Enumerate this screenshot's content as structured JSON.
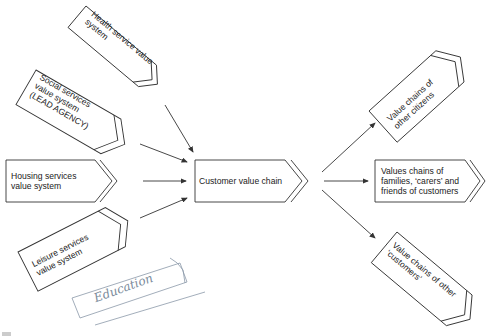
{
  "diagram": {
    "inputs": [
      {
        "id": "health",
        "label_lines": [
          "Health service value",
          "system"
        ]
      },
      {
        "id": "social",
        "label_lines": [
          "Social services",
          "value system",
          "(LEAD AGENCY)"
        ]
      },
      {
        "id": "housing",
        "label_lines": [
          "Housing services",
          "value system"
        ]
      },
      {
        "id": "leisure",
        "label_lines": [
          "Leisure services",
          "value system"
        ]
      }
    ],
    "center": {
      "label": "Customer value chain"
    },
    "outputs": [
      {
        "id": "citizens",
        "label_lines": [
          "Value chains of",
          "other citizens"
        ]
      },
      {
        "id": "families",
        "label_lines": [
          "Values chains of",
          "families, ‘carers’ and",
          "friends of customers"
        ]
      },
      {
        "id": "others",
        "label_lines": [
          "Value chains of other",
          "‘customers’"
        ]
      }
    ],
    "annotation": {
      "handwritten": "Education",
      "note": "handwritten pencil box"
    },
    "colors": {
      "stroke": "#333333",
      "background": "#ffffff",
      "pencil": "#7a8a9a"
    }
  }
}
